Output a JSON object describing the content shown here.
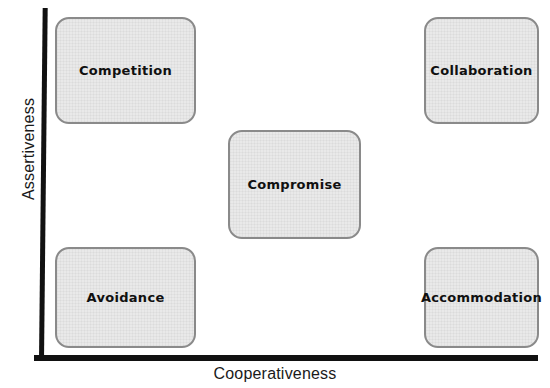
{
  "diagram": {
    "type": "conflict-management-grid",
    "axes": {
      "y_label": "Assertiveness",
      "x_label": "Cooperativeness"
    },
    "colors": {
      "box_fill": "#e9e9e9",
      "box_border": "#8a8a8a",
      "axis": "#111111",
      "text": "#101010",
      "background": "#ffffff"
    },
    "boxes": [
      {
        "id": "competition",
        "label": "Competition",
        "position": "top-left"
      },
      {
        "id": "collaboration",
        "label": "Collaboration",
        "position": "top-right"
      },
      {
        "id": "compromise",
        "label": "Compromise",
        "position": "center"
      },
      {
        "id": "avoidance",
        "label": "Avoidance",
        "position": "bottom-left"
      },
      {
        "id": "accommodation",
        "label": "Accommodation",
        "position": "bottom-right"
      }
    ]
  }
}
